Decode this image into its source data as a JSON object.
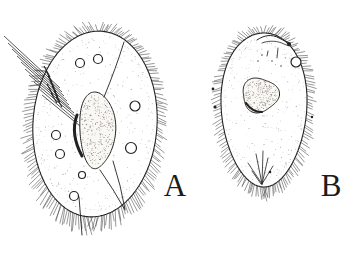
{
  "figure": {
    "ink_color": "#222222",
    "paper_color": "#ffffff",
    "cells": [
      {
        "label": "A",
        "body": {
          "cx": 95,
          "cy": 124,
          "rx": 62,
          "ry": 93,
          "rotate": 4
        },
        "cilia": {
          "count": 190,
          "length": 9,
          "bottom_boost": 0.55
        },
        "nucleus": {
          "cx": 97,
          "cy": 131,
          "rx": 21,
          "ry": 38,
          "taper": 0.15,
          "wobble": 0.05,
          "wphase": 1.2,
          "dots": 340
        },
        "vacuoles": [
          [
            80,
            63,
            4.5
          ],
          [
            98,
            59,
            4.5
          ],
          [
            135,
            106,
            5
          ],
          [
            131,
            148,
            5.5
          ],
          [
            56,
            135,
            4.5
          ],
          [
            60,
            154,
            4.5
          ],
          [
            82,
            175,
            3.5
          ],
          [
            74,
            196,
            4.5
          ]
        ],
        "oral_lines": [
          [
            4,
            36,
            60,
            88
          ],
          [
            8,
            43,
            62,
            92
          ],
          [
            12,
            49,
            64,
            96
          ],
          [
            17,
            56,
            67,
            101
          ],
          [
            21,
            62,
            69,
            105
          ],
          [
            25,
            69,
            71,
            109
          ],
          [
            29,
            75,
            74,
            113
          ],
          [
            34,
            82,
            76,
            117
          ],
          [
            38,
            88,
            78,
            122
          ],
          [
            42,
            95,
            80,
            126
          ]
        ],
        "crosshatch": [
          [
            44,
            66,
            50,
            77
          ],
          [
            46,
            71,
            52,
            82
          ],
          [
            48,
            76,
            54,
            87
          ],
          [
            50,
            81,
            56,
            92
          ],
          [
            52,
            86,
            58,
            97
          ],
          [
            54,
            91,
            60,
            102
          ],
          [
            56,
            97,
            62,
            107
          ],
          [
            47,
            84,
            53,
            95
          ],
          [
            51,
            93,
            57,
            103
          ]
        ],
        "paths": [
          {
            "d": "M 124,42 Q 116,68 104,97",
            "w": 0.9
          },
          {
            "d": "M 100,170 Q 114,190 125,210",
            "w": 0.9
          },
          {
            "d": "M 113,161 Q 121,186 125,209",
            "w": 0.9
          },
          {
            "d": "M 77,115 Q 70,134 82,156",
            "w": 3
          },
          {
            "d": "M 79,197 L 82,235",
            "w": 0.9
          }
        ],
        "spots": []
      },
      {
        "label": "B",
        "body": {
          "cx": 264,
          "cy": 110,
          "rx": 48,
          "ry": 77,
          "taper": 0.11
        },
        "cilia": {
          "count": 150,
          "length": 8,
          "bottom_boost": 0.35
        },
        "nucleus": {
          "cx": 260,
          "cy": 95,
          "rx": 18,
          "ry": 17,
          "wobble": 0.09,
          "wphase": 2,
          "dots": 250
        },
        "vacuoles": [
          [
            296,
            62,
            5
          ]
        ],
        "oral_lines": [],
        "crosshatch": [],
        "paths": [
          {
            "d": "M 257,40 C 264,35 272,34 279,38 C 284,41 288,41 291,45",
            "w": 1
          },
          {
            "d": "M 262,43 C 270,40 278,41 284,44 L 289,46",
            "w": 0.8
          },
          {
            "d": "M 278,48 L 277,58",
            "w": 0.8
          },
          {
            "d": "M 268,51 L 267,56",
            "w": 0.8
          },
          {
            "d": "M 246,103 Q 252,112 262,112",
            "w": 2.2
          },
          {
            "d": "M 262,184 L 248,163",
            "w": 0.8
          },
          {
            "d": "M 262,184 L 256,154",
            "w": 0.8
          },
          {
            "d": "M 262,184 L 263,151",
            "w": 0.8
          },
          {
            "d": "M 262,184 L 268,158",
            "w": 0.8
          },
          {
            "d": "M 262,184 L 273,166",
            "w": 0.8
          },
          {
            "d": "M 261,184 L 252,171",
            "w": 0.8
          }
        ],
        "spots": [
          [
            289,
            44,
            2
          ],
          [
            270,
            172,
            1.3
          ],
          [
            213,
            89,
            1.4
          ],
          [
            215,
            107,
            1.6
          ],
          [
            312,
            117,
            1.2
          ],
          [
            262,
            55,
            0.7
          ],
          [
            272,
            61,
            0.7
          ],
          [
            281,
            66,
            0.7
          ],
          [
            258,
            61,
            0.7
          ]
        ]
      }
    ]
  }
}
